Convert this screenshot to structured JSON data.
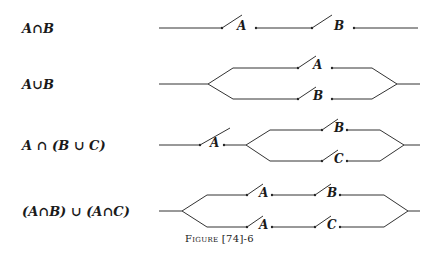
{
  "rows": [
    {
      "expression": "A∩B",
      "type": "series",
      "switches": [
        "A",
        "B"
      ]
    },
    {
      "expression": "A∪B",
      "type": "parallel",
      "switches": {
        "top": "A",
        "bottom": "B"
      }
    },
    {
      "expression": "A ∩ (B ∪ C)",
      "type": "series-parallel",
      "switches": {
        "series": "A",
        "top": "B",
        "bottom": "C"
      }
    },
    {
      "expression": "(A∩B) ∪ (A∩C)",
      "type": "parallel-series",
      "switches": {
        "top": [
          "A",
          "B"
        ],
        "bottom": [
          "A",
          "C"
        ]
      }
    }
  ],
  "labels": {
    "r1a": "A",
    "r1b": "B",
    "r2a": "A",
    "r2b": "B",
    "r3a": "A",
    "r3b": "B",
    "r3c": "C",
    "r4a1": "A",
    "r4b": "B",
    "r4a2": "A",
    "r4c": "C"
  },
  "caption": "Figure [74]-6"
}
